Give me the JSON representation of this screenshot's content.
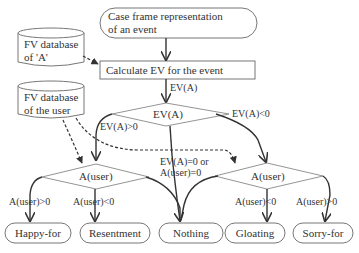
{
  "nodes": {
    "start": {
      "line1": "Case frame representation",
      "line2": "of an event"
    },
    "db_a": {
      "line1": "FV database",
      "line2": "of 'A'"
    },
    "db_user": {
      "line1": "FV database",
      "line2": "of the user"
    },
    "calc": {
      "label": "Calculate EV for the event"
    },
    "ev_decision": {
      "label": "EV(A)"
    },
    "auser_left": {
      "label": "A(user)"
    },
    "auser_right": {
      "label": "A(user)"
    },
    "outcomes": [
      {
        "label": "Happy-for"
      },
      {
        "label": "Resentment"
      },
      {
        "label": "Nothing"
      },
      {
        "label": "Gloating"
      },
      {
        "label": "Sorry-for"
      }
    ]
  },
  "edges": {
    "calc_to_ev": "EV(A)",
    "ev_pos": "EV(A)>0",
    "ev_neg": "EV(A)<0",
    "ev_zero_line1": "EV(A)=0 or",
    "ev_zero_line2": "A(user)=0",
    "left_pos": "A(user)>0",
    "left_neg": "A(user)<0",
    "right_neg": "A(user)<0",
    "right_pos": "A(user)>0"
  }
}
